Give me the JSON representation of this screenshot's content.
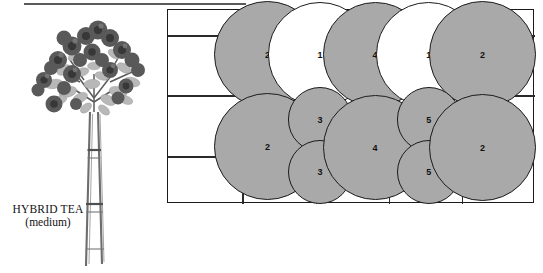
{
  "figure": {
    "caption_line1": "HYBRID TEA",
    "caption_line2": "(medium)",
    "plant_icon": "rose-bush-illustration",
    "top_rule": "horizontal-rule"
  },
  "diagram": {
    "name": "planting-spacing-grid",
    "columns": 5,
    "rows": 2,
    "grid_color": "#2a2a2a",
    "border_color": "#1b1b1b",
    "filled_color": "#a9a9a9",
    "open_color": "#ffffff",
    "circles": [
      {
        "label": "2",
        "fill": "filled",
        "cx": 38.0,
        "cy": 23.0,
        "d": 41.0
      },
      {
        "label": "1",
        "fill": "open",
        "cx": 58.0,
        "cy": 23.0,
        "d": 40.0
      },
      {
        "label": "4",
        "fill": "filled",
        "cx": 79.0,
        "cy": 23.0,
        "d": 40.0
      },
      {
        "label": "1",
        "fill": "open",
        "cx": 99.5,
        "cy": 23.0,
        "d": 40.0
      },
      {
        "label": "2",
        "fill": "filled",
        "cx": 120.0,
        "cy": 23.0,
        "d": 41.0
      },
      {
        "label": "2",
        "fill": "filled",
        "cx": 38.0,
        "cy": 70.5,
        "d": 41.0
      },
      {
        "label": "3",
        "fill": "filled",
        "cx": 58.0,
        "cy": 56.5,
        "d": 24.5
      },
      {
        "label": "3",
        "fill": "filled",
        "cx": 58.0,
        "cy": 83.5,
        "d": 24.5
      },
      {
        "label": "4",
        "fill": "filled",
        "cx": 79.0,
        "cy": 71.0,
        "d": 40.0
      },
      {
        "label": "5",
        "fill": "filled",
        "cx": 99.5,
        "cy": 56.5,
        "d": 24.5
      },
      {
        "label": "5",
        "fill": "filled",
        "cx": 99.5,
        "cy": 83.5,
        "d": 24.5
      },
      {
        "label": "2",
        "fill": "filled",
        "cx": 120.0,
        "cy": 71.0,
        "d": 41.0
      }
    ],
    "vertical_lines_pct": [
      20.2,
      40.3,
      60.1,
      80.0
    ],
    "horizontal_lines_pct": [
      {
        "y": 44.0,
        "x1": 0,
        "x2": 100
      },
      {
        "y": 13.0,
        "x1": 0,
        "x2": 100
      },
      {
        "y": 75.5,
        "x1": 0,
        "x2": 100
      }
    ]
  }
}
